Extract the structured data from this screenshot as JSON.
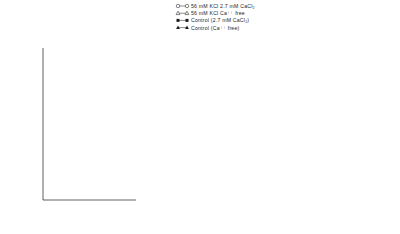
{
  "figure": {
    "xlabel": "fraction number",
    "ylabel": "percent of total radioactivity per fraction",
    "xticks": [
      6,
      8,
      10,
      12,
      14
    ],
    "yticks": [
      1,
      2,
      3,
      4,
      5,
      6,
      7
    ],
    "axis_break_symbol": "//",
    "arrow_fraction": 7
  },
  "legend": {
    "items": [
      {
        "marker": "open-circle-icon",
        "label": "56 mM KCl  2.7 mM CaCl₂"
      },
      {
        "marker": "open-triangle-icon",
        "label": "56 mM KCl  Ca⁺⁺ free"
      },
      {
        "marker": "filled-square-icon",
        "label": "Control (2.7 mM CaCl₂)"
      },
      {
        "marker": "filled-triangle-icon",
        "label": "Control (Ca⁺⁺ free)"
      }
    ]
  },
  "chart_data": {
    "type": "line",
    "title": "",
    "xlabel": "fraction number",
    "ylabel": "percent of total radioactivity per fraction",
    "xlim": [
      5.4,
      14.6
    ],
    "ylim": [
      0.4,
      7.3
    ],
    "grid": false,
    "legend_position": "top-center",
    "panels": [
      {
        "id": "a",
        "panel_letter": "a",
        "trace_label": "³H DA",
        "x": [
          6,
          7,
          8,
          9,
          10,
          11,
          12,
          13,
          14
        ],
        "series": [
          {
            "name": "56 mM KCl  2.7 mM CaCl₂",
            "marker": "open-circle",
            "values": [
              4.05,
              3.75,
              3.35,
              3.25,
              5.45,
              6.85,
              6.3,
              5.75,
              5.2
            ]
          },
          {
            "name": "56 mM KCl  Ca⁺⁺ free",
            "marker": "open-triangle",
            "values": [
              4.05,
              3.7,
              3.3,
              3.0,
              3.55,
              4.4,
              4.8,
              5.05,
              5.15
            ]
          },
          {
            "name": "Control (2.7 mM CaCl₂)",
            "marker": "filled-square",
            "values": [
              4.15,
              3.6,
              3.3,
              3.2,
              3.15,
              3.1,
              3.0,
              2.95,
              2.9
            ]
          },
          {
            "name": "Control (Ca⁺⁺ free)",
            "marker": "filled-triangle",
            "values": [
              3.65,
              3.3,
              3.2,
              3.05,
              2.9,
              2.8,
              2.7,
              2.6,
              2.55
            ]
          }
        ]
      },
      {
        "id": "b",
        "panel_letter": "b",
        "trace_label": "³H NE",
        "x": [
          6,
          7,
          8,
          9,
          10,
          11,
          12,
          13,
          14
        ],
        "series": [
          {
            "name": "56 mM KCl  2.7 mM CaCl₂",
            "marker": "open-circle",
            "values": [
              2.7,
              2.55,
              2.3,
              2.45,
              3.85,
              4.65,
              3.95,
              3.25,
              2.6
            ]
          },
          {
            "name": "56 mM KCl  Ca⁺⁺ free",
            "marker": "open-triangle",
            "values": [
              2.85,
              2.55,
              2.3,
              2.15,
              2.05,
              2.0,
              1.9,
              1.85,
              1.75
            ]
          },
          {
            "name": "Control (2.7 mM CaCl₂)",
            "marker": "filled-square",
            "values": [
              2.8,
              2.5,
              2.25,
              2.05,
              1.9,
              1.8,
              1.65,
              1.5,
              1.4
            ]
          },
          {
            "name": "Control (Ca⁺⁺ free)",
            "marker": "filled-triangle",
            "values": [
              2.8,
              2.5,
              2.25,
              2.05,
              1.9,
              1.8,
              1.65,
              1.5,
              1.4
            ]
          }
        ]
      },
      {
        "id": "c",
        "panel_letter": "c",
        "trace_label": "³H 5HT",
        "x": [
          6,
          7,
          8,
          9,
          10,
          11,
          12,
          13,
          14
        ],
        "series": [
          {
            "name": "56 mM KCl  2.7 mM CaCl₂",
            "marker": "open-circle",
            "values": [
              3.8,
              3.35,
              3.0,
              3.35,
              4.55,
              5.35,
              5.0,
              4.35,
              3.6
            ]
          },
          {
            "name": "56 mM KCl  Ca⁺⁺ free",
            "marker": "open-triangle",
            "values": [
              3.8,
              3.35,
              3.0,
              2.8,
              2.6,
              2.45,
              2.35,
              2.3,
              2.25
            ]
          },
          {
            "name": "Control (2.7 mM CaCl₂)",
            "marker": "filled-square",
            "values": [
              3.8,
              3.35,
              3.05,
              2.75,
              2.55,
              2.4,
              2.25,
              2.1,
              1.95
            ]
          },
          {
            "name": "Control (Ca⁺⁺ free)",
            "marker": "filled-triangle",
            "values": [
              3.8,
              3.35,
              3.05,
              2.75,
              2.55,
              2.4,
              2.25,
              2.1,
              1.95
            ]
          }
        ]
      }
    ]
  }
}
